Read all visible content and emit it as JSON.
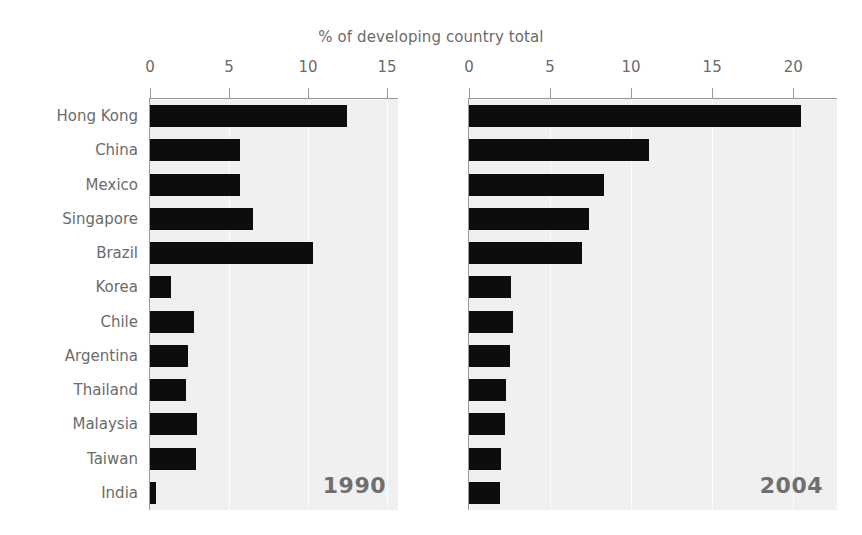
{
  "chart_data": {
    "type": "bar",
    "title": "% of developing country total",
    "xlabel": "",
    "ylabel": "",
    "orientation": "horizontal",
    "grid": true,
    "legend": "none",
    "categories": [
      "Hong Kong",
      "China",
      "Mexico",
      "Singapore",
      "Brazil",
      "Korea",
      "Chile",
      "Argentina",
      "Thailand",
      "Malaysia",
      "Taiwan",
      "India"
    ],
    "panels": [
      {
        "name": "1990",
        "label": "1990",
        "xlim": [
          0,
          15.7
        ],
        "xticks": [
          0,
          5,
          10,
          15
        ],
        "xticklabels": [
          "0",
          "5",
          "10",
          "15"
        ],
        "values": [
          12.5,
          5.7,
          5.7,
          6.5,
          10.3,
          1.3,
          2.8,
          2.4,
          2.3,
          3.0,
          2.9,
          0.4
        ]
      },
      {
        "name": "2004",
        "label": "2004",
        "xlim": [
          0,
          22.7
        ],
        "xticks": [
          0,
          5,
          10,
          15,
          20
        ],
        "xticklabels": [
          "0",
          "5",
          "10",
          "15",
          "20"
        ],
        "values": [
          20.5,
          11.1,
          8.3,
          7.4,
          7.0,
          2.6,
          2.7,
          2.5,
          2.3,
          2.2,
          2.0,
          1.9
        ]
      }
    ],
    "series": [
      {
        "name": "1990",
        "values": [
          12.5,
          5.7,
          5.7,
          6.5,
          10.3,
          1.3,
          2.8,
          2.4,
          2.3,
          3.0,
          2.9,
          0.4
        ]
      },
      {
        "name": "2004",
        "values": [
          20.5,
          11.1,
          8.3,
          7.4,
          7.0,
          2.6,
          2.7,
          2.5,
          2.3,
          2.2,
          2.0,
          1.9
        ]
      }
    ],
    "colors": {
      "bar": "#0d0d0d",
      "plot_background": "#f0f0f0",
      "gridline": "#ffffff",
      "axis": "#9a9a9a",
      "text": "#6b6b6b",
      "year_text": "#6f6f6f",
      "figure_background": "#ffffff"
    }
  }
}
